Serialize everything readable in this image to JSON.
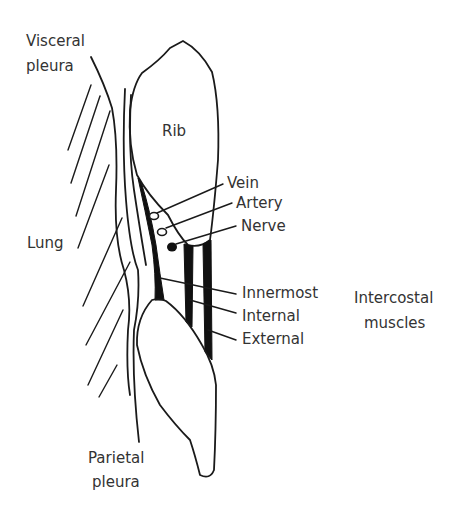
{
  "diagram": {
    "labels": {
      "visceral_pleura_1": "Visceral",
      "visceral_pleura_2": "pleura",
      "rib": "Rib",
      "vein": "Vein",
      "artery": "Artery",
      "nerve": "Nerve",
      "lung": "Lung",
      "innermost": "Innermost",
      "internal": "Internal",
      "external": "External",
      "intercostal_1": "Intercostal",
      "intercostal_2": "muscles",
      "parietal_pleura_1": "Parietal",
      "parietal_pleura_2": "pleura"
    },
    "colors": {
      "line": "#1a1a1a",
      "text": "#333333",
      "background": "#ffffff"
    }
  }
}
